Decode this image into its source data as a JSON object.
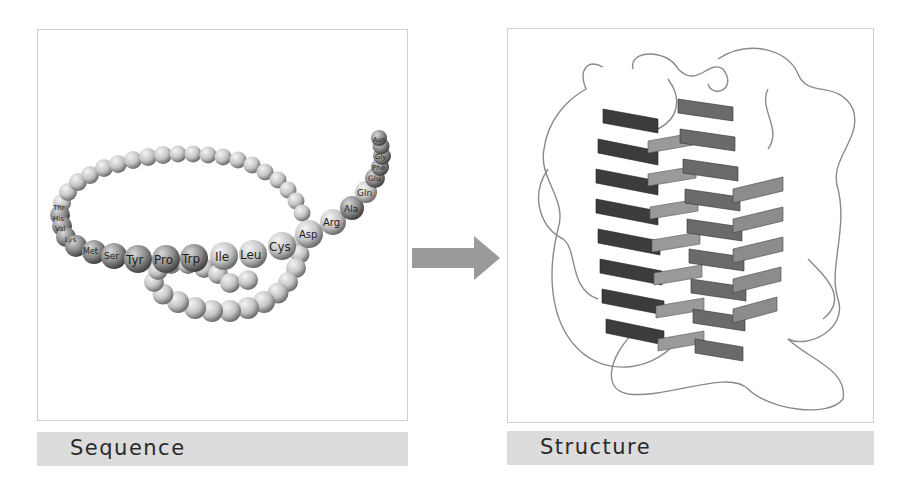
{
  "diagram": {
    "left": {
      "caption": "Sequence",
      "description": "Chain of amino acid beads (primary sequence)",
      "labeled_residues": [
        "Thr",
        "His",
        "Val",
        "Lys",
        "Met",
        "Ser",
        "Tyr",
        "Pro",
        "Trp",
        "Ile",
        "Leu",
        "Cys",
        "Asp",
        "Arg",
        "Ala",
        "Gln",
        "Glu",
        "Phe",
        "Gly",
        "Asn"
      ]
    },
    "arrow": {
      "direction": "right",
      "color": "#9a9a9a"
    },
    "right": {
      "caption": "Structure",
      "description": "3D folded protein with alpha-helix ribbons and loops"
    },
    "colors": {
      "bead": "#c8c8c8",
      "bead_dark": "#7a7a7a",
      "helix_dark": "#3c3c3c",
      "helix_mid": "#6a6a6a",
      "helix_light": "#9a9a9a",
      "loop": "#8a8a8a",
      "caption_bg": "#dcdcdc"
    }
  }
}
